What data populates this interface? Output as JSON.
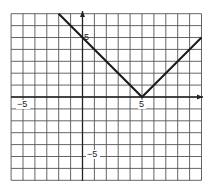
{
  "chart_data": {
    "type": "line",
    "title": "",
    "function": "y = |x - 5|",
    "xlabel": "",
    "ylabel": "",
    "xlim": [
      -6,
      10
    ],
    "ylim": [
      -7,
      7
    ],
    "grid": true,
    "grid_step": 1,
    "tick_labels": {
      "x": [
        {
          "value": -5,
          "label": "−5"
        },
        {
          "value": 5,
          "label": "5"
        }
      ],
      "y": [
        {
          "value": 5,
          "label": "5"
        },
        {
          "value": -5,
          "label": "−5"
        }
      ]
    },
    "series": [
      {
        "name": "f(x)",
        "x": [
          -2,
          5,
          10
        ],
        "y": [
          7,
          0,
          5
        ]
      }
    ],
    "colors": {
      "grid": "#555555",
      "axis": "#222222",
      "line": "#1a1a1a"
    }
  },
  "labels": {
    "x_neg5": "−5",
    "x_pos5": "5",
    "y_pos5": "5",
    "y_neg5": "−5"
  }
}
